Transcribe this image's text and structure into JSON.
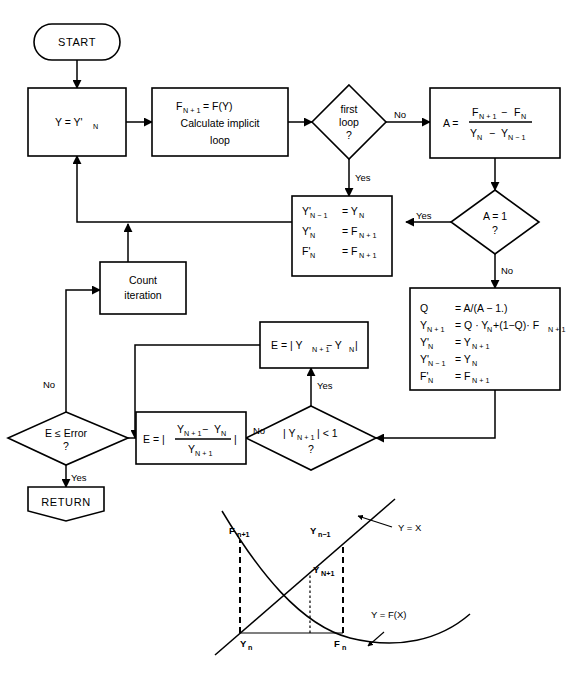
{
  "diagram": {
    "line_color": "#000000",
    "background": "#ffffff"
  },
  "nodes": {
    "start": {
      "label": "START",
      "shape": "terminator-rounded"
    },
    "assign_y": {
      "label": "Y = Y'",
      "subscript": "N",
      "shape": "process"
    },
    "calc": {
      "line1_lhs": "F",
      "line1_sub": "N + 1",
      "line1_rhs": "= F(Y)",
      "line2": "Calculate  implicit",
      "line3": "loop",
      "shape": "process"
    },
    "first_loop": {
      "line1": "first",
      "line2": "loop",
      "line3": "?",
      "shape": "decision"
    },
    "calc_a": {
      "lhs": "A =",
      "num_a": "F",
      "num_a_sub": "N + 1",
      "num_op": "−",
      "num_b": "F",
      "num_b_sub": "N",
      "den_a": "Y",
      "den_a_sub": "N",
      "den_op": "−",
      "den_b": "Y",
      "den_b_sub": "N − 1",
      "shape": "process-fraction"
    },
    "a_equals_1": {
      "line1": "A = 1",
      "line2": "?",
      "shape": "decision"
    },
    "save_prev": {
      "rows": [
        {
          "lhs": "Y'",
          "lhs_sub": "N − 1",
          "rhs": "= Y",
          "rhs_sub": "N"
        },
        {
          "lhs": "Y'",
          "lhs_sub": "N",
          "rhs": "= F",
          "rhs_sub": "N + 1"
        },
        {
          "lhs": "F'",
          "lhs_sub": "N",
          "rhs": "= F",
          "rhs_sub": "N + 1"
        }
      ],
      "shape": "process"
    },
    "aitken": {
      "rows": [
        {
          "lhs": "Q",
          "lhs_sub": "",
          "rhs": "= A/(A − 1.)"
        },
        {
          "lhs": "Y",
          "lhs_sub": "N + 1",
          "rhs": "= Q · Y",
          "rhs_sub": "N",
          "rhs2": "+(1−Q)· F",
          "rhs2_sub": "N + 1"
        },
        {
          "lhs": "Y'",
          "lhs_sub": "N",
          "rhs": "= Y",
          "rhs_sub": "N + 1"
        },
        {
          "lhs": "Y'",
          "lhs_sub": "N − 1",
          "rhs": "= Y",
          "rhs_sub": "N"
        },
        {
          "lhs": "F'",
          "lhs_sub": "N",
          "rhs": "= F",
          "rhs_sub": "N + 1"
        }
      ],
      "shape": "process"
    },
    "abs_test": {
      "expr": "| Y",
      "expr_sub": "N + 1",
      "expr_tail": "| < 1",
      "line2": "?",
      "shape": "decision"
    },
    "err_abs": {
      "lhs": "E = | Y",
      "lhs_sub": "N + 1",
      "mid": "− Y",
      "mid_sub": "N",
      "tail": "|",
      "shape": "process"
    },
    "err_rel": {
      "lhs": "E = |",
      "num_a": "Y",
      "num_a_sub": "N + 1",
      "num_op": "−",
      "num_b": "Y",
      "num_b_sub": "N",
      "den": "Y",
      "den_sub": "N + 1",
      "tail": "|",
      "shape": "process-fraction"
    },
    "count_iteration": {
      "line1": "Count",
      "line2": "iteration",
      "shape": "process"
    },
    "error_test": {
      "line1": "E ≤ Error",
      "line2": "?",
      "shape": "decision"
    },
    "return": {
      "label": "RETURN",
      "shape": "terminator-pentagon"
    }
  },
  "edge_labels": {
    "first_loop_no": "No",
    "first_loop_yes": "Yes",
    "a_equals_1_yes": "Yes",
    "a_equals_1_no": "No",
    "abs_test_yes": "Yes",
    "abs_test_no": "No",
    "error_test_no": "No",
    "error_test_yes": "Yes"
  },
  "inset_graph": {
    "type": "line",
    "title": "",
    "curves": [
      {
        "name": "Y = X",
        "label": "Y = X",
        "kind": "straight-line",
        "slope": 1
      },
      {
        "name": "Y = F(X)",
        "label": "Y = F(X)",
        "kind": "decreasing-convex-curve"
      }
    ],
    "point_labels": [
      {
        "text": "F",
        "sub": "n+1",
        "position": "upper-left-on-curve"
      },
      {
        "text": "Y",
        "sub": "n−1",
        "position": "upper-right-on-line"
      },
      {
        "text": "Y",
        "sub": "N+1",
        "position": "middle"
      },
      {
        "text": "Y",
        "sub": "n",
        "position": "x-axis-left"
      },
      {
        "text": "F",
        "sub": "n",
        "position": "x-axis-right"
      }
    ],
    "axis_labels": {
      "line_label": "Y = X",
      "curve_label": "Y = F(X)"
    },
    "grid": false,
    "legend": "inline-annotations"
  }
}
